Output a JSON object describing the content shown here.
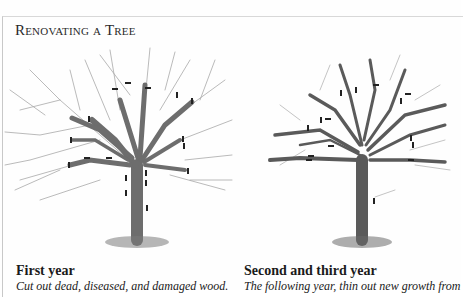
{
  "title": "Renovating a Tree",
  "panels": [
    {
      "heading": "First year",
      "text": "Cut out dead, diseased, and damaged wood."
    },
    {
      "heading": "Second and third year",
      "text": "The following year, thin out new growth from"
    }
  ],
  "colors": {
    "ink": "#1a1a1a",
    "trunk": "#6d6d6d",
    "twig": "#9a9a9a",
    "cut_mark": "#222222"
  }
}
